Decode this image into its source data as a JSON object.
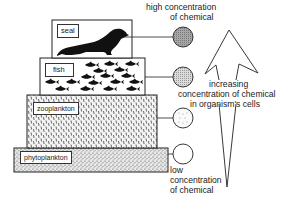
{
  "diagram": {
    "type": "food-chain-bioaccumulation",
    "levels": [
      {
        "name": "seal",
        "label": "seal",
        "concentration": "highest",
        "circle_fill": "#9a9a9a"
      },
      {
        "name": "fish",
        "label": "fish",
        "concentration": "high",
        "circle_fill": "#cfcfcf"
      },
      {
        "name": "zooplankton",
        "label": "zooplankton",
        "concentration": "low",
        "circle_fill": "#f4f4f4"
      },
      {
        "name": "phytoplankton",
        "label": "phytoplankton",
        "concentration": "lowest",
        "circle_fill": "#ffffff"
      }
    ],
    "top_label": {
      "line1": "high  concentration",
      "line2": "of chemical"
    },
    "bottom_label": {
      "line1": "low",
      "line2": "concentration",
      "line3": "of chemical"
    },
    "arrow_label": {
      "line1": "increasing",
      "line2": "concentration of chemical",
      "line3": "in organism's cells"
    }
  }
}
